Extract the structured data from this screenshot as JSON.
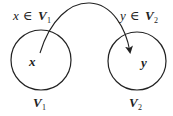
{
  "diagram": {
    "sets": [
      {
        "name": "V",
        "subscript": "1",
        "element": "x",
        "membership": {
          "var": "x",
          "symbol": "∈",
          "set": "V",
          "subscript": "1"
        }
      },
      {
        "name": "V",
        "subscript": "2",
        "element": "y",
        "membership": {
          "var": "y",
          "symbol": "∈",
          "set": "V",
          "subscript": "2"
        }
      }
    ],
    "arrow": {
      "from": "x",
      "to": "y"
    },
    "colors": {
      "stroke": "#222222",
      "background": "#ffffff"
    }
  }
}
